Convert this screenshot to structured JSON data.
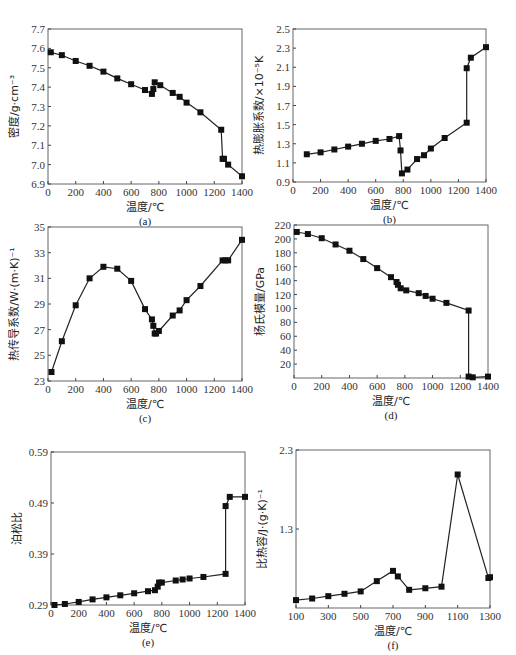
{
  "figure": {
    "caption": ""
  },
  "chart_data": [
    {
      "id": "a",
      "type": "line",
      "panel_label": "(a)",
      "title": "",
      "xlabel": "温度/℃",
      "ylabel": "密度/g·cm⁻³",
      "xlim": [
        0,
        1400
      ],
      "ylim": [
        6.9,
        7.7
      ],
      "xticks": [
        0,
        200,
        400,
        600,
        800,
        1000,
        1200,
        1400
      ],
      "yticks": [
        6.9,
        7.0,
        7.1,
        7.2,
        7.3,
        7.4,
        7.5,
        7.6,
        7.7
      ],
      "ytick_labels": [
        "6.9",
        "7.0",
        "7.1",
        "7.2",
        "7.3",
        "7.4",
        "7.5",
        "7.6",
        "7.7"
      ],
      "grid": false,
      "series": [
        {
          "name": "density",
          "x": [
            20,
            100,
            200,
            300,
            400,
            500,
            600,
            700,
            750,
            760,
            770,
            810,
            900,
            950,
            1000,
            1100,
            1250,
            1260,
            1270,
            1300,
            1400
          ],
          "y": [
            7.58,
            7.565,
            7.535,
            7.51,
            7.48,
            7.445,
            7.415,
            7.385,
            7.365,
            7.39,
            7.425,
            7.41,
            7.37,
            7.35,
            7.32,
            7.27,
            7.18,
            7.03,
            7.03,
            7.0,
            6.94
          ]
        }
      ]
    },
    {
      "id": "b",
      "type": "line",
      "panel_label": "(b)",
      "title": "",
      "xlabel": "温度/℃",
      "ylabel": "热膨胀系数/×10⁻⁵K",
      "xlim": [
        0,
        1400
      ],
      "ylim": [
        0.9,
        2.5
      ],
      "xticks": [
        0,
        200,
        400,
        600,
        800,
        1000,
        1200,
        1400
      ],
      "yticks": [
        0.9,
        1.1,
        1.3,
        1.5,
        1.7,
        1.9,
        2.1,
        2.3,
        2.5
      ],
      "ytick_labels": [
        "0.9",
        "1.1",
        "1.3",
        "1.5",
        "1.7",
        "1.9",
        "2.1",
        "2.3",
        "2.5"
      ],
      "grid": false,
      "series": [
        {
          "name": "thermal-expansion",
          "x": [
            100,
            200,
            300,
            400,
            500,
            600,
            700,
            770,
            780,
            790,
            830,
            900,
            950,
            1000,
            1100,
            1260,
            1260,
            1290,
            1400
          ],
          "y": [
            1.19,
            1.21,
            1.24,
            1.27,
            1.3,
            1.33,
            1.35,
            1.38,
            1.23,
            0.99,
            1.03,
            1.14,
            1.18,
            1.25,
            1.36,
            1.52,
            2.09,
            2.2,
            2.31
          ]
        }
      ]
    },
    {
      "id": "c",
      "type": "line",
      "panel_label": "(c)",
      "title": "",
      "xlabel": "温度/℃",
      "ylabel": "热传导系数/W·(m·K)⁻¹",
      "xlim": [
        0,
        1400
      ],
      "ylim": [
        23,
        35
      ],
      "xticks": [
        0,
        200,
        400,
        600,
        800,
        1000,
        1200,
        1400
      ],
      "yticks": [
        23,
        25,
        27,
        29,
        31,
        33,
        35
      ],
      "ytick_labels": [
        "23",
        "25",
        "27",
        "29",
        "31",
        "33",
        "35"
      ],
      "grid": false,
      "series": [
        {
          "name": "thermal-conductivity",
          "x": [
            25,
            100,
            200,
            300,
            400,
            500,
            600,
            700,
            750,
            760,
            770,
            780,
            800,
            900,
            950,
            1000,
            1100,
            1260,
            1280,
            1300,
            1400
          ],
          "y": [
            23.7,
            26.1,
            28.9,
            31.0,
            31.9,
            31.75,
            30.8,
            28.6,
            27.8,
            27.3,
            26.7,
            26.7,
            26.9,
            28.1,
            28.5,
            29.3,
            30.4,
            32.4,
            32.4,
            32.4,
            34.0
          ]
        }
      ]
    },
    {
      "id": "d",
      "type": "line",
      "panel_label": "(d)",
      "title": "",
      "xlabel": "温度/℃",
      "ylabel": "杨氏模量/GPa",
      "xlim": [
        0,
        1400
      ],
      "ylim": [
        0,
        220
      ],
      "xticks": [
        0,
        200,
        400,
        600,
        800,
        1000,
        1200,
        1400
      ],
      "yticks": [
        20,
        40,
        60,
        80,
        100,
        120,
        140,
        160,
        180,
        200,
        220
      ],
      "ytick_labels": [
        "20",
        "40",
        "60",
        "80",
        "100",
        "120",
        "140",
        "160",
        "180",
        "200",
        "220"
      ],
      "grid": false,
      "series": [
        {
          "name": "youngs-modulus",
          "x": [
            20,
            100,
            200,
            300,
            400,
            500,
            600,
            700,
            740,
            750,
            770,
            810,
            900,
            950,
            1000,
            1100,
            1260,
            1260,
            1290,
            1400
          ],
          "y": [
            210,
            207,
            201,
            192,
            183,
            171,
            158,
            145,
            138,
            134,
            129,
            126,
            122,
            118,
            114,
            108,
            97,
            2,
            1,
            2
          ]
        }
      ]
    },
    {
      "id": "e",
      "type": "line",
      "panel_label": "(e)",
      "title": "",
      "xlabel": "温度/℃",
      "ylabel": "泊松比",
      "xlim": [
        0,
        1400
      ],
      "ylim": [
        0.29,
        0.59
      ],
      "xticks": [
        0,
        200,
        400,
        600,
        800,
        1000,
        1200,
        1400
      ],
      "yticks": [
        0.29,
        0.39,
        0.49,
        0.59
      ],
      "ytick_labels": [
        "0.29",
        "0.39",
        "0.49",
        "0.59"
      ],
      "grid": false,
      "series": [
        {
          "name": "poisson-ratio",
          "x": [
            25,
            100,
            200,
            300,
            400,
            500,
            600,
            700,
            750,
            770,
            780,
            800,
            900,
            950,
            1000,
            1100,
            1260,
            1260,
            1290,
            1400
          ],
          "y": [
            0.29,
            0.292,
            0.296,
            0.301,
            0.305,
            0.309,
            0.313,
            0.317,
            0.319,
            0.326,
            0.334,
            0.334,
            0.338,
            0.34,
            0.342,
            0.345,
            0.351,
            0.484,
            0.502,
            0.502
          ]
        }
      ]
    },
    {
      "id": "f",
      "type": "line",
      "panel_label": "(f)",
      "title": "",
      "xlabel": "温度/℃",
      "ylabel": "比热容/J·(g·K)⁻¹",
      "xlim": [
        100,
        1300
      ],
      "ylim": [
        0.3,
        2.3
      ],
      "xticks": [
        100,
        300,
        500,
        700,
        900,
        1100,
        1300
      ],
      "yticks": [
        1.3,
        2.3
      ],
      "ytick_labels": [
        "1.3",
        "2.3"
      ],
      "grid": false,
      "series": [
        {
          "name": "specific-heat",
          "x": [
            100,
            200,
            300,
            400,
            500,
            600,
            700,
            730,
            800,
            900,
            1000,
            1100,
            1290,
            1300
          ],
          "y": [
            0.4,
            0.42,
            0.45,
            0.48,
            0.51,
            0.64,
            0.77,
            0.7,
            0.53,
            0.55,
            0.57,
            1.99,
            0.68,
            0.69
          ]
        }
      ]
    }
  ]
}
